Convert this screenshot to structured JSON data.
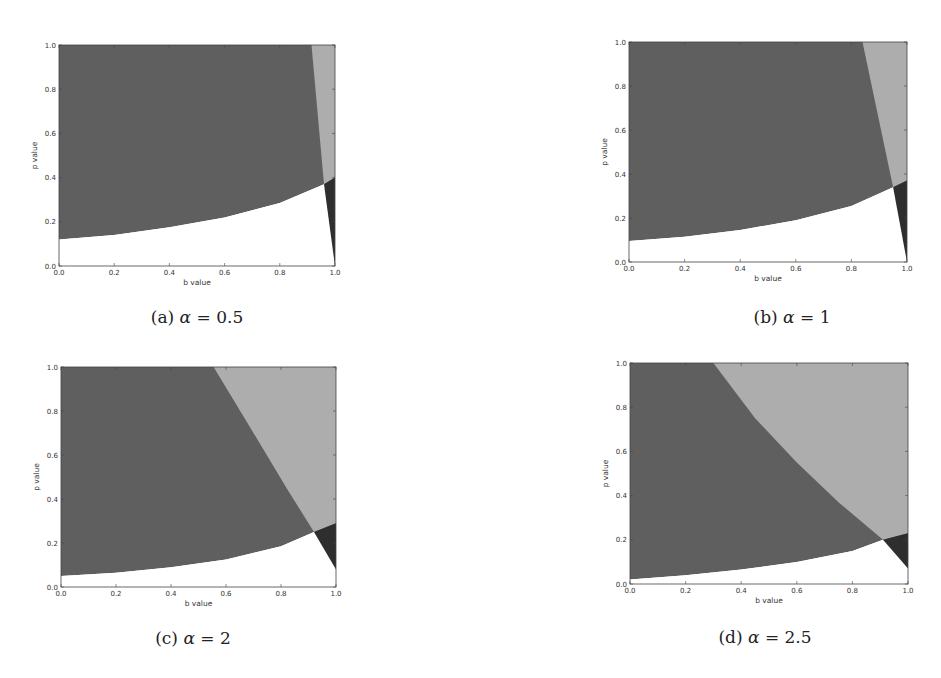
{
  "figure": {
    "captions": [
      {
        "label": "(a)",
        "symbol": "α",
        "eq": "= 0.5"
      },
      {
        "label": "(b)",
        "symbol": "α",
        "eq": "= 1"
      },
      {
        "label": "(c)",
        "symbol": "α",
        "eq": "= 2"
      },
      {
        "label": "(d)",
        "symbol": "α",
        "eq": "= 2.5"
      }
    ]
  },
  "colors": {
    "region_mid": "#5f5f5f",
    "region_light": "#adadad",
    "region_dark": "#2e2e2e",
    "region_empty": "#ffffff",
    "axis": "#444444"
  },
  "chart_data": [
    {
      "type": "area",
      "title": "(a) α = 0.5",
      "xlabel": "b value",
      "ylabel": "p value",
      "xlim": [
        0,
        1
      ],
      "ylim": [
        0,
        1
      ],
      "xticks": [
        "0.0",
        "0.2",
        "0.4",
        "0.6",
        "0.8",
        "1.0"
      ],
      "yticks": [
        "0.0",
        "0.2",
        "0.4",
        "0.6",
        "0.8",
        "1.0"
      ],
      "grid": false,
      "regions": {
        "lower_boundary": [
          [
            0,
            0.12
          ],
          [
            0.2,
            0.14
          ],
          [
            0.4,
            0.175
          ],
          [
            0.6,
            0.22
          ],
          [
            0.8,
            0.285
          ],
          [
            0.96,
            0.37
          ]
        ],
        "light_boundary": [
          [
            0.915,
            1.0
          ],
          [
            0.96,
            0.37
          ]
        ],
        "dark_triangle": [
          [
            0.96,
            0.37
          ],
          [
            1.0,
            0.4
          ],
          [
            1.0,
            0.0
          ]
        ]
      }
    },
    {
      "type": "area",
      "title": "(b) α = 1",
      "xlabel": "b value",
      "ylabel": "p value",
      "xlim": [
        0,
        1
      ],
      "ylim": [
        0,
        1
      ],
      "xticks": [
        "0.0",
        "0.2",
        "0.4",
        "0.6",
        "0.8",
        "1.0"
      ],
      "yticks": [
        "0.0",
        "0.2",
        "0.4",
        "0.6",
        "0.8",
        "1.0"
      ],
      "grid": false,
      "regions": {
        "lower_boundary": [
          [
            0,
            0.095
          ],
          [
            0.2,
            0.115
          ],
          [
            0.4,
            0.145
          ],
          [
            0.6,
            0.19
          ],
          [
            0.8,
            0.255
          ],
          [
            0.95,
            0.34
          ]
        ],
        "light_boundary": [
          [
            0.84,
            1.0
          ],
          [
            0.95,
            0.34
          ]
        ],
        "dark_triangle": [
          [
            0.95,
            0.34
          ],
          [
            1.0,
            0.37
          ],
          [
            1.0,
            0.0
          ]
        ]
      }
    },
    {
      "type": "area",
      "title": "(c) α = 2",
      "xlabel": "b value",
      "ylabel": "p value",
      "xlim": [
        0,
        1
      ],
      "ylim": [
        0,
        1
      ],
      "xticks": [
        "0.0",
        "0.2",
        "0.4",
        "0.6",
        "0.8",
        "1.0"
      ],
      "yticks": [
        "0.0",
        "0.2",
        "0.4",
        "0.6",
        "0.8",
        "1.0"
      ],
      "grid": false,
      "regions": {
        "lower_boundary": [
          [
            0,
            0.05
          ],
          [
            0.2,
            0.065
          ],
          [
            0.4,
            0.09
          ],
          [
            0.6,
            0.125
          ],
          [
            0.8,
            0.185
          ],
          [
            0.92,
            0.25
          ]
        ],
        "light_boundary": [
          [
            0.555,
            1.0
          ],
          [
            0.7,
            0.7
          ],
          [
            0.82,
            0.45
          ],
          [
            0.92,
            0.25
          ]
        ],
        "dark_triangle": [
          [
            0.92,
            0.25
          ],
          [
            1.0,
            0.29
          ],
          [
            1.0,
            0.08
          ]
        ]
      }
    },
    {
      "type": "area",
      "title": "(d) α = 2.5",
      "xlabel": "b value",
      "ylabel": "p value",
      "xlim": [
        0,
        1
      ],
      "ylim": [
        0,
        1
      ],
      "xticks": [
        "0.0",
        "0.2",
        "0.4",
        "0.6",
        "0.8",
        "1.0"
      ],
      "yticks": [
        "0.0",
        "0.2",
        "0.4",
        "0.6",
        "0.8",
        "1.0"
      ],
      "grid": false,
      "regions": {
        "lower_boundary": [
          [
            0,
            0.02
          ],
          [
            0.2,
            0.04
          ],
          [
            0.4,
            0.065
          ],
          [
            0.6,
            0.1
          ],
          [
            0.8,
            0.15
          ],
          [
            0.91,
            0.2
          ]
        ],
        "light_boundary": [
          [
            0.3,
            1.0
          ],
          [
            0.45,
            0.75
          ],
          [
            0.6,
            0.55
          ],
          [
            0.75,
            0.37
          ],
          [
            0.91,
            0.2
          ]
        ],
        "dark_triangle": [
          [
            0.91,
            0.2
          ],
          [
            1.0,
            0.23
          ],
          [
            1.0,
            0.07
          ]
        ]
      }
    }
  ]
}
